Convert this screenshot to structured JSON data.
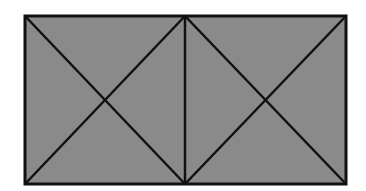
{
  "diagram": {
    "colors": {
      "background": "#ffffff",
      "fill": "#8a8a8a",
      "stroke": "#111111"
    },
    "outer_rect": {
      "x": 25,
      "y": 16,
      "width": 321,
      "height": 168
    },
    "divider_x": 185,
    "squares": [
      {
        "id": "left",
        "x1": 25,
        "y1": 16,
        "x2": 185,
        "y2": 184
      },
      {
        "id": "right",
        "x1": 185,
        "y1": 16,
        "x2": 346,
        "y2": 184
      }
    ]
  }
}
